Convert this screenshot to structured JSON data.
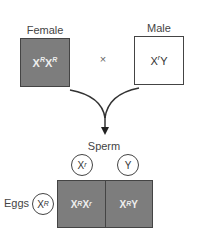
{
  "parents": {
    "female": {
      "label": "Female",
      "genotype_base1": "X",
      "allele1": "R",
      "genotype_base2": "X",
      "allele2": "R",
      "fill": "#7d7d7d"
    },
    "male": {
      "label": "Male",
      "genotype_base": "X",
      "allele": "r",
      "second": "Y",
      "fill": "#ffffff"
    },
    "cross_symbol": "×"
  },
  "gametes": {
    "sperm_label": "Sperm",
    "sperm": [
      {
        "base": "X",
        "allele": "r"
      },
      {
        "base": "Y",
        "allele": ""
      }
    ],
    "eggs_label": "Eggs",
    "eggs": [
      {
        "base": "X",
        "allele": "R"
      }
    ]
  },
  "offspring": [
    {
      "base1": "X",
      "allele1": "R",
      "base2": "X",
      "allele2": "r"
    },
    {
      "base1": "X",
      "allele1": "R",
      "base2": "Y",
      "allele2": ""
    }
  ]
}
